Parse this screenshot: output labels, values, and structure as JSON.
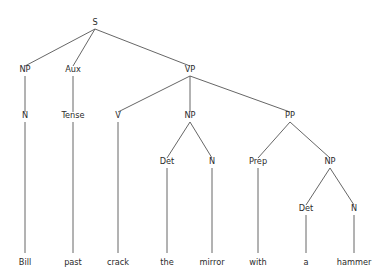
{
  "diagram": {
    "type": "syntax-tree",
    "sentence": "Bill past crack the mirror with a hammer",
    "background_color": "#ffffff",
    "line_color": "#555555",
    "text_color": "#2b2b2b",
    "nodes": {
      "s": {
        "label": "S",
        "x": 95,
        "y": 25
      },
      "np_subject": {
        "label": "NP",
        "x": 25,
        "y": 72
      },
      "aux": {
        "label": "Aux",
        "x": 73,
        "y": 72
      },
      "vp": {
        "label": "VP",
        "x": 190,
        "y": 72
      },
      "n_subject": {
        "label": "N",
        "x": 25,
        "y": 118
      },
      "tense": {
        "label": "Tense",
        "x": 73,
        "y": 118
      },
      "v": {
        "label": "V",
        "x": 118,
        "y": 118
      },
      "np_object": {
        "label": "NP",
        "x": 190,
        "y": 118
      },
      "pp": {
        "label": "PP",
        "x": 290,
        "y": 118
      },
      "det_object": {
        "label": "Det",
        "x": 167,
        "y": 164
      },
      "n_object": {
        "label": "N",
        "x": 212,
        "y": 164
      },
      "prep": {
        "label": "Prep",
        "x": 258,
        "y": 164
      },
      "np_oblique": {
        "label": "NP",
        "x": 330,
        "y": 164
      },
      "det_oblique": {
        "label": "Det",
        "x": 306,
        "y": 211
      },
      "n_oblique": {
        "label": "N",
        "x": 354,
        "y": 211
      }
    },
    "terminals": [
      {
        "id": "t-bill",
        "label": "Bill",
        "x": 25,
        "y": 265,
        "parent": "n_subject"
      },
      {
        "id": "t-past",
        "label": "past",
        "x": 73,
        "y": 265,
        "parent": "tense"
      },
      {
        "id": "t-crack",
        "label": "crack",
        "x": 118,
        "y": 265,
        "parent": "v"
      },
      {
        "id": "t-the",
        "label": "the",
        "x": 167,
        "y": 265,
        "parent": "det_object"
      },
      {
        "id": "t-mirror",
        "label": "mirror",
        "x": 212,
        "y": 265,
        "parent": "n_object"
      },
      {
        "id": "t-with",
        "label": "with",
        "x": 258,
        "y": 265,
        "parent": "prep"
      },
      {
        "id": "t-a",
        "label": "a",
        "x": 306,
        "y": 265,
        "parent": "det_oblique"
      },
      {
        "id": "t-hammer",
        "label": "hammer",
        "x": 354,
        "y": 265,
        "parent": "n_oblique"
      }
    ],
    "edges": [
      {
        "id": "e-s-np",
        "from": "s",
        "to": "np_subject",
        "x1": 95,
        "y1": 29,
        "x2": 25,
        "y2": 66
      },
      {
        "id": "e-s-aux",
        "from": "s",
        "to": "aux",
        "x1": 95,
        "y1": 29,
        "x2": 73,
        "y2": 66
      },
      {
        "id": "e-s-vp",
        "from": "s",
        "to": "vp",
        "x1": 95,
        "y1": 29,
        "x2": 190,
        "y2": 66
      },
      {
        "id": "e-np-n",
        "from": "np_subject",
        "to": "n_subject",
        "x1": 25,
        "y1": 76,
        "x2": 25,
        "y2": 112
      },
      {
        "id": "e-aux-tense",
        "from": "aux",
        "to": "tense",
        "x1": 73,
        "y1": 76,
        "x2": 73,
        "y2": 112
      },
      {
        "id": "e-vp-v",
        "from": "vp",
        "to": "v",
        "x1": 190,
        "y1": 76,
        "x2": 118,
        "y2": 112
      },
      {
        "id": "e-vp-np",
        "from": "vp",
        "to": "np_object",
        "x1": 190,
        "y1": 76,
        "x2": 190,
        "y2": 112
      },
      {
        "id": "e-vp-pp",
        "from": "vp",
        "to": "pp",
        "x1": 190,
        "y1": 76,
        "x2": 290,
        "y2": 112
      },
      {
        "id": "e-n-bill",
        "from": "n_subject",
        "to": "t-bill",
        "x1": 25,
        "y1": 122,
        "x2": 25,
        "y2": 253
      },
      {
        "id": "e-tense-past",
        "from": "tense",
        "to": "t-past",
        "x1": 73,
        "y1": 122,
        "x2": 73,
        "y2": 253
      },
      {
        "id": "e-v-crack",
        "from": "v",
        "to": "t-crack",
        "x1": 118,
        "y1": 122,
        "x2": 118,
        "y2": 253
      },
      {
        "id": "e-npobj-det",
        "from": "np_object",
        "to": "det_object",
        "x1": 190,
        "y1": 122,
        "x2": 167,
        "y2": 158
      },
      {
        "id": "e-npobj-n",
        "from": "np_object",
        "to": "n_object",
        "x1": 190,
        "y1": 122,
        "x2": 212,
        "y2": 158
      },
      {
        "id": "e-pp-prep",
        "from": "pp",
        "to": "prep",
        "x1": 290,
        "y1": 122,
        "x2": 258,
        "y2": 158
      },
      {
        "id": "e-pp-np",
        "from": "pp",
        "to": "np_oblique",
        "x1": 290,
        "y1": 122,
        "x2": 330,
        "y2": 158
      },
      {
        "id": "e-det-the",
        "from": "det_object",
        "to": "t-the",
        "x1": 167,
        "y1": 168,
        "x2": 167,
        "y2": 253
      },
      {
        "id": "e-n-mirror",
        "from": "n_object",
        "to": "t-mirror",
        "x1": 212,
        "y1": 168,
        "x2": 212,
        "y2": 253
      },
      {
        "id": "e-prep-with",
        "from": "prep",
        "to": "t-with",
        "x1": 258,
        "y1": 168,
        "x2": 258,
        "y2": 253
      },
      {
        "id": "e-npobl-det",
        "from": "np_oblique",
        "to": "det_oblique",
        "x1": 330,
        "y1": 168,
        "x2": 306,
        "y2": 205
      },
      {
        "id": "e-npobl-n",
        "from": "np_oblique",
        "to": "n_oblique",
        "x1": 330,
        "y1": 168,
        "x2": 354,
        "y2": 205
      },
      {
        "id": "e-detobl-a",
        "from": "det_oblique",
        "to": "t-a",
        "x1": 306,
        "y1": 215,
        "x2": 306,
        "y2": 253
      },
      {
        "id": "e-nobl-hammer",
        "from": "n_oblique",
        "to": "t-hammer",
        "x1": 354,
        "y1": 215,
        "x2": 354,
        "y2": 253
      }
    ]
  }
}
